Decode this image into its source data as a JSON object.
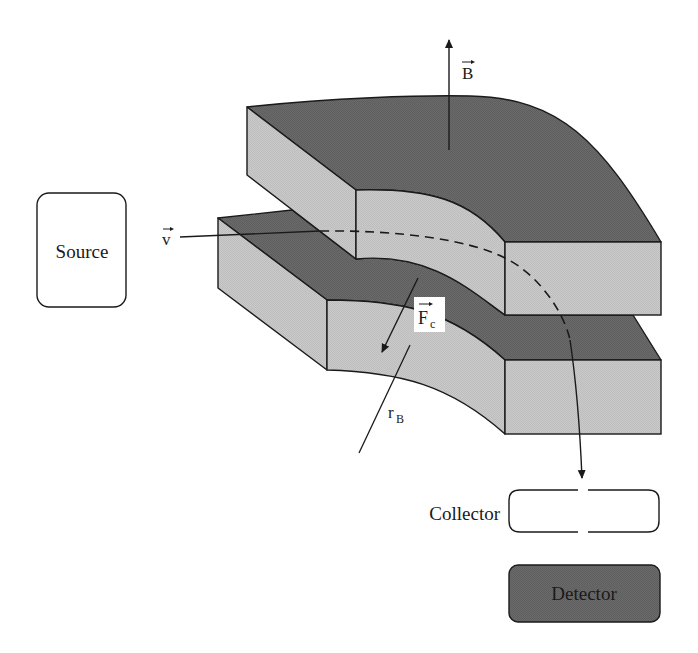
{
  "diagram": {
    "type": "magnetic-sector-mass-spectrometer",
    "colors": {
      "top_face": "#6b6b6b",
      "side_face": "#c9c9c9",
      "outline": "#1a1a1a",
      "detector_fill": "#737373",
      "background": "#ffffff"
    },
    "labels": {
      "source": "Source",
      "collector": "Collector",
      "detector": "Detector",
      "velocity": "v",
      "magnetic_field": "B",
      "centripetal_force": "F",
      "centripetal_force_sub": "c",
      "radius": "r",
      "radius_sub": "B"
    },
    "components": [
      {
        "id": "source",
        "label": "Source",
        "shape": "rounded-rectangle"
      },
      {
        "id": "upper-magnet-pole",
        "shape": "curved-slab"
      },
      {
        "id": "lower-magnet-pole",
        "shape": "curved-slab"
      },
      {
        "id": "collector",
        "label": "Collector",
        "shape": "rounded-rectangle-with-slit"
      },
      {
        "id": "detector",
        "label": "Detector",
        "shape": "rounded-rectangle-filled"
      }
    ],
    "vectors": [
      {
        "id": "velocity",
        "symbol": "v",
        "direction": "into magnet gap"
      },
      {
        "id": "magnetic-field",
        "symbol": "B",
        "direction": "up"
      },
      {
        "id": "centripetal-force",
        "symbol": "F_c",
        "direction": "toward center of curvature"
      },
      {
        "id": "radius",
        "symbol": "r_B"
      }
    ]
  }
}
